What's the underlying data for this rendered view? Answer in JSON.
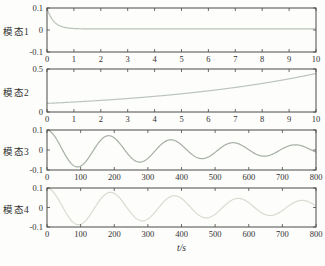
{
  "xlabel": "t/s",
  "figure_bg": "#fdfdfc",
  "axis_color": "#4a4a48",
  "text_color": "#333130",
  "chart_data": [
    {
      "type": "line",
      "label": "模态1",
      "xlabel": "",
      "ylabel": "模态1",
      "xlim": [
        0,
        10
      ],
      "ylim": [
        -0.1,
        0.1
      ],
      "xticks": [
        0,
        1,
        2,
        3,
        4,
        5,
        6,
        7,
        8,
        9,
        10
      ],
      "yticks": [
        -0.1,
        0,
        0.1
      ],
      "ytick_labels": [
        "-0.1",
        "0",
        "0.1"
      ],
      "grid": false,
      "legend": "none",
      "color": "#b8c2b6",
      "description": "fast exponential decay from 0.1 to ~0.005",
      "generator": {
        "kind": "exp_decay",
        "y0": 0.095,
        "tau": 0.25,
        "offset": 0.005
      },
      "points": [
        [
          0,
          0.1
        ],
        [
          0.25,
          0.04
        ],
        [
          0.5,
          0.018
        ],
        [
          1,
          0.007
        ],
        [
          2,
          0.005
        ],
        [
          5,
          0.005
        ],
        [
          10,
          0.005
        ]
      ]
    },
    {
      "type": "line",
      "label": "模态2",
      "xlabel": "",
      "ylabel": "模态2",
      "xlim": [
        0,
        10
      ],
      "ylim": [
        0,
        0.5
      ],
      "xticks": [
        0,
        1,
        2,
        3,
        4,
        5,
        6,
        7,
        8,
        9,
        10
      ],
      "yticks": [
        0,
        0.5
      ],
      "ytick_labels": [
        "0",
        "0.5"
      ],
      "grid": false,
      "legend": "none",
      "color": "#bcc4bc",
      "description": "slow exponential growth from 0.1 to ~0.45",
      "generator": {
        "kind": "exp_growth",
        "y0": 0.1,
        "rate": 0.15
      },
      "points": [
        [
          0,
          0.1
        ],
        [
          2,
          0.135
        ],
        [
          4,
          0.182
        ],
        [
          6,
          0.246
        ],
        [
          8,
          0.332
        ],
        [
          10,
          0.448
        ]
      ]
    },
    {
      "type": "line",
      "label": "模态3",
      "xlabel": "",
      "ylabel": "模态3",
      "xlim": [
        0,
        800
      ],
      "ylim": [
        -0.1,
        0.1
      ],
      "xticks": [
        0,
        100,
        200,
        300,
        400,
        500,
        600,
        700,
        800
      ],
      "yticks": [
        -0.1,
        0,
        0.1
      ],
      "ytick_labels": [
        "-0.1",
        "0",
        "0.1"
      ],
      "grid": false,
      "legend": "none",
      "color": "#a6b0a4",
      "description": "damped oscillation, period ~185 s, amplitude 0.1 decaying to ~0.025",
      "generator": {
        "kind": "damped_cosine",
        "amplitude": 0.1,
        "tau": 550,
        "period": 185
      },
      "points": [
        [
          0,
          0.1
        ],
        [
          92,
          -0.085
        ],
        [
          185,
          0.071
        ],
        [
          278,
          -0.06
        ],
        [
          370,
          0.051
        ],
        [
          462,
          -0.043
        ],
        [
          555,
          0.036
        ],
        [
          648,
          -0.031
        ],
        [
          740,
          0.026
        ],
        [
          800,
          -0.011
        ]
      ]
    },
    {
      "type": "line",
      "label": "模态4",
      "xlabel": "t/s",
      "ylabel": "模态4",
      "xlim": [
        0,
        800
      ],
      "ylim": [
        -0.1,
        0.1
      ],
      "xticks": [
        0,
        100,
        200,
        300,
        400,
        500,
        600,
        700,
        800
      ],
      "yticks": [
        -0.1,
        0,
        0.1
      ],
      "ytick_labels": [
        "-0.1",
        "0",
        "0.1"
      ],
      "grid": false,
      "legend": "none",
      "color": "#d8dcd0",
      "description": "damped oscillation, period ~190 s, amplitude 0.1 decaying to ~0.035, very light trace",
      "generator": {
        "kind": "damped_cosine",
        "amplitude": 0.1,
        "tau": 750,
        "period": 190
      },
      "points": [
        [
          0,
          0.1
        ],
        [
          95,
          -0.088
        ],
        [
          190,
          0.078
        ],
        [
          285,
          -0.068
        ],
        [
          380,
          0.06
        ],
        [
          475,
          -0.053
        ],
        [
          570,
          0.047
        ],
        [
          665,
          -0.041
        ],
        [
          760,
          0.036
        ],
        [
          800,
          0.009
        ]
      ]
    }
  ]
}
